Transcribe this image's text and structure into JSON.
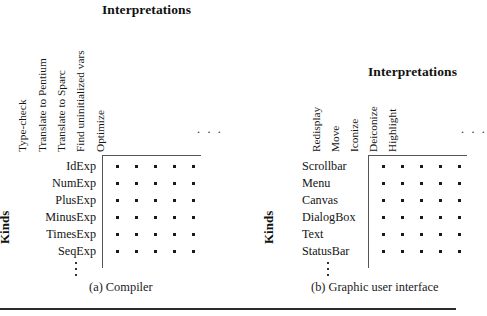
{
  "figure": {
    "bottom_rule": true
  },
  "panels": [
    {
      "id": "compiler",
      "title": "Interpretations",
      "axis_label": "Kinds",
      "caption": "(a) Compiler",
      "columns": [
        "Type-check",
        "Translate to Pentium",
        "Translate to Sparc",
        "Find uninitialized vars",
        "Optimize"
      ],
      "column_ellipsis": ". . .",
      "rows": [
        "IdExp",
        "NumExp",
        "PlusExp",
        "MinusExp",
        "TimesExp",
        "SeqExp"
      ],
      "row_ellipsis": "vertical-dots",
      "matrix": [
        [
          1,
          1,
          1,
          1,
          1
        ],
        [
          1,
          1,
          1,
          1,
          1
        ],
        [
          1,
          1,
          1,
          1,
          1
        ],
        [
          1,
          1,
          1,
          1,
          1
        ],
        [
          1,
          1,
          1,
          1,
          1
        ],
        [
          1,
          1,
          1,
          1,
          1
        ]
      ]
    },
    {
      "id": "gui",
      "title": "Interpretations",
      "axis_label": "Kinds",
      "caption": "(b) Graphic user interface",
      "columns": [
        "Redisplay",
        "Move",
        "Iconize",
        "Deiconize",
        "Highlight"
      ],
      "column_ellipsis": ". . .",
      "rows": [
        "Scrollbar",
        "Menu",
        "Canvas",
        "DialogBox",
        "Text",
        "StatusBar"
      ],
      "row_ellipsis": "vertical-dots",
      "matrix": [
        [
          1,
          1,
          1,
          1,
          1
        ],
        [
          1,
          1,
          1,
          1,
          1
        ],
        [
          1,
          1,
          1,
          1,
          1
        ],
        [
          1,
          1,
          1,
          1,
          1
        ],
        [
          1,
          1,
          1,
          1,
          1
        ],
        [
          1,
          1,
          1,
          1,
          1
        ]
      ]
    }
  ],
  "colors": {
    "ink": "#1a1a1a",
    "rule": "#555555",
    "bottom_rule": "#2c2c2c",
    "background": "#ffffff"
  }
}
